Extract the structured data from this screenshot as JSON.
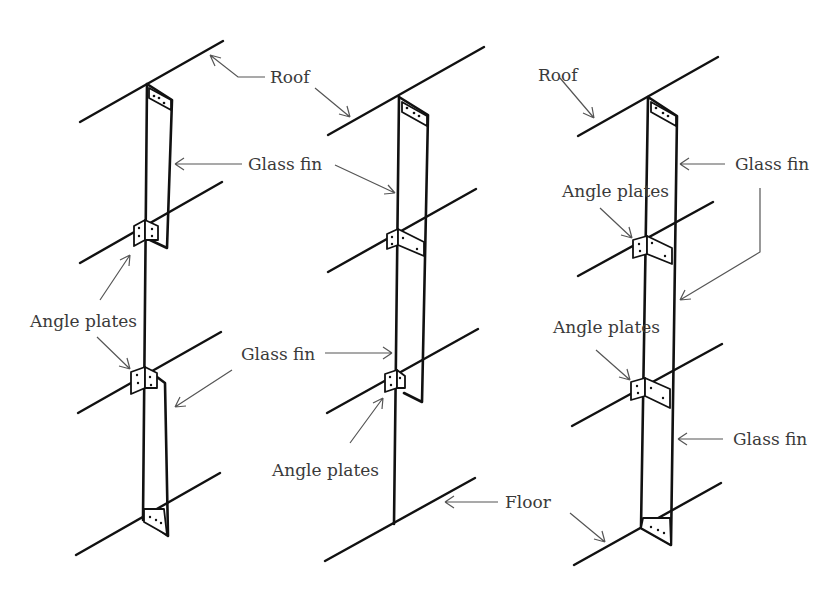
{
  "diagram": {
    "type": "structural-isometric",
    "colors": {
      "line": "#111111",
      "leader": "#555555",
      "text": "#3a3a3a",
      "background": "#ffffff"
    },
    "panels": [
      {
        "id": "left",
        "labels": {
          "roof": "Roof",
          "glass_fin_upper": "Glass fin",
          "angle_plates": "Angle plates",
          "glass_fin_lower": "Glass fin"
        }
      },
      {
        "id": "middle",
        "labels": {
          "roof": "Roof",
          "glass_fin_upper": "Glass fin",
          "glass_fin_lower": "Glass fin",
          "angle_plates": "Angle plates",
          "floor": "Floor"
        }
      },
      {
        "id": "right",
        "labels": {
          "roof": "Roof",
          "glass_fin_upper": "Glass fin",
          "angle_plates_upper": "Angle plates",
          "angle_plates_lower": "Angle plates",
          "glass_fin_lower": "Glass fin"
        }
      }
    ],
    "text": {
      "roof_left": "Roof",
      "roof_right": "Roof",
      "glass_fin_1": "Glass fin",
      "glass_fin_2": "Glass fin",
      "glass_fin_3": "Glass fin",
      "glass_fin_4": "Glass fin",
      "angle_plates_1": "Angle plates",
      "angle_plates_2": "Angle plates",
      "angle_plates_3": "Angle plates",
      "angle_plates_4": "Angle plates",
      "floor": "Floor"
    }
  }
}
